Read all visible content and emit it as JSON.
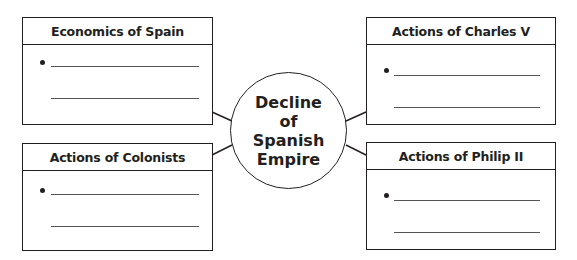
{
  "center": {
    "title_lines": [
      "Decline of",
      "Spanish",
      "Empire"
    ]
  },
  "boxes": [
    {
      "id": "economics-of-spain",
      "title": "Economics of Spain",
      "position": "top-left",
      "lines": 2,
      "bullets": 1
    },
    {
      "id": "actions-of-colonists",
      "title": "Actions of Colonists",
      "position": "bottom-left",
      "lines": 2,
      "bullets": 1
    },
    {
      "id": "actions-of-charles-v",
      "title": "Actions of Charles V",
      "position": "top-right",
      "lines": 2,
      "bullets": 1
    },
    {
      "id": "actions-of-philip-ii",
      "title": "Actions of Philip II",
      "position": "bottom-right",
      "lines": 2,
      "bullets": 1
    }
  ],
  "colors": {
    "stroke": "#231f20",
    "line": "#555555",
    "background": "#ffffff"
  }
}
